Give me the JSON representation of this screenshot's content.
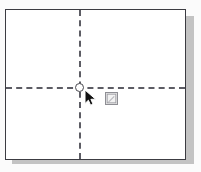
{
  "app": {
    "view_name": "page-layout-canvas",
    "background_color": "#fbfbfb"
  },
  "page": {
    "label": "Document page",
    "background_color": "#ffffff",
    "border_color": "#3c3c42",
    "shadow_color": "#b8b8b8"
  },
  "guides": {
    "horizontal": {
      "label": "Horizontal guide line",
      "style": "dashed",
      "color": "#5c5c64",
      "position_pct": 52
    },
    "vertical": {
      "label": "Vertical guide line",
      "style": "dashed",
      "color": "#5c5c64",
      "position_pct": 41
    },
    "intersection_handle": {
      "label": "Guide intersection handle",
      "shape": "circle",
      "fill": "#ffffff",
      "stroke": "#4a4a50"
    }
  },
  "pointer": {
    "icon": "arrow-cursor-icon",
    "color": "#111111"
  },
  "action_tag": {
    "icon": "smart-tag-icon",
    "tooltip": "",
    "fill": "#e2e2e2",
    "border": "#8e8e94"
  }
}
